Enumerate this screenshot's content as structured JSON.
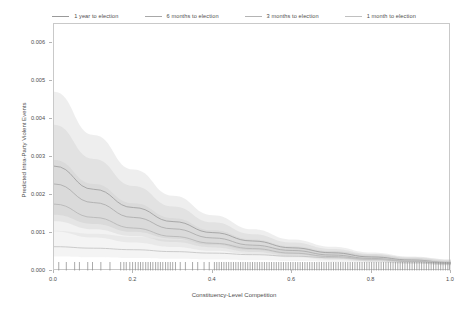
{
  "chart_data": {
    "type": "line",
    "title": "",
    "xlabel": "Constituency-Level Competition",
    "ylabel": "Predicted Intra-Party Violent Events",
    "xlim": [
      0.0,
      1.0
    ],
    "ylim": [
      0.0,
      0.0065
    ],
    "grid": false,
    "legend_position": "top-center",
    "xticks": [
      "0.0",
      "0.2",
      "0.4",
      "0.6",
      "0.8",
      "1.0"
    ],
    "xtick_values": [
      0.0,
      0.2,
      0.4,
      0.6,
      0.8,
      1.0
    ],
    "yticks": [
      "0.000",
      "0.001",
      "0.002",
      "0.003",
      "0.004",
      "0.005",
      "0.006"
    ],
    "ytick_values": [
      0.0,
      0.001,
      0.002,
      0.003,
      0.004,
      0.005,
      0.006
    ],
    "x": [
      0.0,
      0.1,
      0.2,
      0.3,
      0.4,
      0.5,
      0.6,
      0.7,
      0.8,
      0.9,
      1.0
    ],
    "series": [
      {
        "name": "1 year to election",
        "color": "#9a9a9a",
        "values": [
          0.00276,
          0.00215,
          0.00167,
          0.0013,
          0.00101,
          0.00079,
          0.00061,
          0.00048,
          0.00037,
          0.00029,
          0.00022
        ],
        "ci_lower": [
          0.00148,
          0.00124,
          0.00103,
          0.00085,
          0.00069,
          0.00055,
          0.00044,
          0.00035,
          0.00027,
          0.00021,
          0.00016
        ],
        "ci_upper": [
          0.00472,
          0.00358,
          0.00267,
          0.00198,
          0.00147,
          0.0011,
          0.00083,
          0.00064,
          0.00049,
          0.00038,
          0.0003
        ]
      },
      {
        "name": "6 months to election",
        "color": "#a8a8a8",
        "values": [
          0.00229,
          0.0018,
          0.00141,
          0.00111,
          0.00087,
          0.00068,
          0.00054,
          0.00042,
          0.00033,
          0.00026,
          0.00021
        ],
        "ci_lower": [
          0.00131,
          0.0011,
          0.00092,
          0.00076,
          0.00062,
          0.0005,
          0.0004,
          0.00032,
          0.00025,
          0.0002,
          0.00015
        ],
        "ci_upper": [
          0.00385,
          0.00295,
          0.00224,
          0.0017,
          0.00128,
          0.00097,
          0.00075,
          0.00058,
          0.00045,
          0.00035,
          0.00028
        ]
      },
      {
        "name": "3 months to election",
        "color": "#b4b4b4",
        "values": [
          0.00176,
          0.00141,
          0.00113,
          0.00091,
          0.00073,
          0.00059,
          0.00047,
          0.00038,
          0.00031,
          0.00025,
          0.0002
        ],
        "ci_lower": [
          0.00104,
          0.00088,
          0.00075,
          0.00063,
          0.00053,
          0.00044,
          0.00036,
          0.00029,
          0.00024,
          0.00019,
          0.00015
        ],
        "ci_upper": [
          0.00292,
          0.00229,
          0.00178,
          0.00139,
          0.00107,
          0.00083,
          0.00065,
          0.00052,
          0.00041,
          0.00033,
          0.00026
        ]
      },
      {
        "name": "1 month to election",
        "color": "#c0c0c0",
        "values": [
          0.00064,
          0.0006,
          0.00056,
          0.00051,
          0.00047,
          0.00043,
          0.00039,
          0.00035,
          0.00031,
          0.00027,
          0.00023
        ],
        "ci_lower": [
          0.00038,
          0.00036,
          0.00034,
          0.00032,
          0.0003,
          0.00028,
          0.00026,
          0.00024,
          0.00022,
          0.00019,
          0.00017
        ],
        "ci_upper": [
          0.00106,
          0.00098,
          0.0009,
          0.00082,
          0.00074,
          0.00066,
          0.00059,
          0.00052,
          0.00044,
          0.00037,
          0.00031
        ]
      }
    ],
    "rug": {
      "present": true,
      "description": "marginal rug of constituency competition observations along the x-axis",
      "values": [
        0.012,
        0.031,
        0.052,
        0.064,
        0.085,
        0.097,
        0.118,
        0.141,
        0.168,
        0.176,
        0.182,
        0.191,
        0.198,
        0.205,
        0.212,
        0.218,
        0.224,
        0.231,
        0.237,
        0.243,
        0.249,
        0.256,
        0.262,
        0.268,
        0.274,
        0.281,
        0.287,
        0.293,
        0.299,
        0.306,
        0.318,
        0.331,
        0.349,
        0.362,
        0.378,
        0.391,
        0.404,
        0.41,
        0.416,
        0.422,
        0.428,
        0.434,
        0.44,
        0.446,
        0.452,
        0.458,
        0.464,
        0.47,
        0.476,
        0.482,
        0.488,
        0.494,
        0.5,
        0.506,
        0.512,
        0.518,
        0.524,
        0.53,
        0.536,
        0.542,
        0.548,
        0.554,
        0.56,
        0.566,
        0.572,
        0.578,
        0.584,
        0.59,
        0.596,
        0.602,
        0.608,
        0.614,
        0.62,
        0.626,
        0.632,
        0.638,
        0.644,
        0.65,
        0.656,
        0.662,
        0.668,
        0.674,
        0.68,
        0.686,
        0.692,
        0.698,
        0.704,
        0.71,
        0.716,
        0.722,
        0.728,
        0.734,
        0.74,
        0.746,
        0.752,
        0.758,
        0.764,
        0.77,
        0.776,
        0.782,
        0.788,
        0.794,
        0.8,
        0.806,
        0.812,
        0.818,
        0.824,
        0.83,
        0.836,
        0.842,
        0.848,
        0.854,
        0.86,
        0.866,
        0.872,
        0.878,
        0.884,
        0.89,
        0.896,
        0.902,
        0.908,
        0.914,
        0.92,
        0.926,
        0.932,
        0.938,
        0.944,
        0.95,
        0.956,
        0.962,
        0.968,
        0.974,
        0.98,
        0.986,
        0.992,
        0.997
      ]
    }
  },
  "legend": {
    "items": [
      {
        "label": "1 year to election"
      },
      {
        "label": "6 months to election"
      },
      {
        "label": "3 months to election"
      },
      {
        "label": "1 month to election"
      }
    ]
  }
}
